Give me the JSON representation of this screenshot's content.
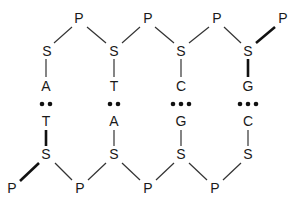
{
  "diagram": {
    "title": "",
    "top_strand": {
      "phosphates": [
        {
          "label": "P",
          "x": 79,
          "y": 18
        },
        {
          "label": "P",
          "x": 148,
          "y": 18
        },
        {
          "label": "P",
          "x": 217,
          "y": 18
        },
        {
          "label": "P",
          "x": 283,
          "y": 18
        }
      ],
      "sugars": [
        {
          "label": "S",
          "x": 47,
          "y": 51
        },
        {
          "label": "S",
          "x": 114,
          "y": 51
        },
        {
          "label": "S",
          "x": 181,
          "y": 51
        },
        {
          "label": "S",
          "x": 248,
          "y": 51
        }
      ],
      "bases": [
        {
          "label": "A",
          "x": 46,
          "y": 86
        },
        {
          "label": "T",
          "x": 114,
          "y": 86
        },
        {
          "label": "C",
          "x": 181,
          "y": 86
        },
        {
          "label": "G",
          "x": 248,
          "y": 86
        }
      ]
    },
    "hydrogen_bonds": [
      {
        "count": 2,
        "x": 46,
        "y": 104
      },
      {
        "count": 2,
        "x": 114,
        "y": 104
      },
      {
        "count": 3,
        "x": 181,
        "y": 104
      },
      {
        "count": 3,
        "x": 248,
        "y": 104
      }
    ],
    "bottom_strand": {
      "bases": [
        {
          "label": "T",
          "x": 46,
          "y": 121
        },
        {
          "label": "A",
          "x": 114,
          "y": 121
        },
        {
          "label": "G",
          "x": 181,
          "y": 121
        },
        {
          "label": "C",
          "x": 248,
          "y": 121
        }
      ],
      "sugars": [
        {
          "label": "S",
          "x": 46,
          "y": 154
        },
        {
          "label": "S",
          "x": 114,
          "y": 154
        },
        {
          "label": "S",
          "x": 181,
          "y": 154
        },
        {
          "label": "S",
          "x": 248,
          "y": 154
        }
      ],
      "phosphates": [
        {
          "label": "P",
          "x": 12,
          "y": 188
        },
        {
          "label": "P",
          "x": 80,
          "y": 188
        },
        {
          "label": "P",
          "x": 148,
          "y": 188
        },
        {
          "label": "P",
          "x": 215,
          "y": 188
        }
      ]
    }
  }
}
